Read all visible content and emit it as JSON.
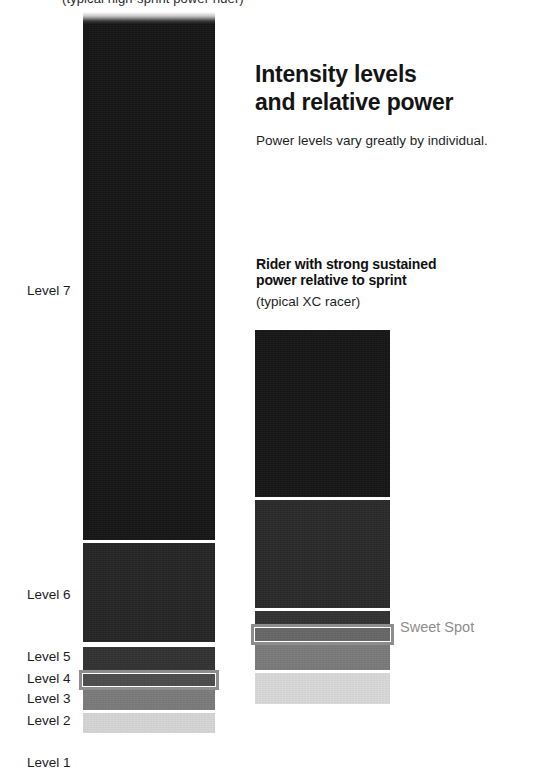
{
  "page": {
    "background": "#ffffff",
    "top_caption": "(typical high-sprint power rider)"
  },
  "headline": {
    "line1": "Intensity levels",
    "line2": "and relative power",
    "subtitle": "Power levels vary greatly by individual."
  },
  "right_chart_heading": {
    "line1": "Rider with strong sustained",
    "line2": "power relative to sprint",
    "sub": "(typical XC racer)"
  },
  "sweet_spot": {
    "label": "Sweet Spot",
    "color": "#8d8d8d"
  },
  "axis": {
    "labels": [
      {
        "text": "Level 7",
        "top": 284
      },
      {
        "text": "Level 6",
        "top": 588
      },
      {
        "text": "Level 5",
        "top": 650
      },
      {
        "text": "Level 4",
        "top": 672
      },
      {
        "text": "Level 3",
        "top": 692
      },
      {
        "text": "Level 2",
        "top": 714
      },
      {
        "text": "Level 1",
        "top": 756
      }
    ]
  },
  "chart_data": {
    "type": "bar",
    "title": "Intensity levels and relative power",
    "subtitle": "Power levels vary greatly by individual.",
    "xlabel": "",
    "ylabel": "Intensity level",
    "orientation": "vertical-stacked",
    "categories": [
      "Level 7",
      "Level 6",
      "Level 5",
      "Level 4",
      "Level 3",
      "Level 2",
      "Level 1"
    ],
    "legend": [
      "Sweet Spot"
    ],
    "grid": false,
    "annotations": [
      "Sweet Spot"
    ],
    "series": [
      {
        "name": "Rider with high sprint power relative to sustained",
        "caption": "(typical high-sprint power rider)",
        "bar_left": 83,
        "bar_right": 215,
        "sweet_spot_level": "Level 4",
        "segments": [
          {
            "level": "Level 7",
            "top": 12,
            "bottom": 540,
            "height": 528,
            "color": "#171717",
            "fade_top": true
          },
          {
            "level": "Level 6",
            "top": 543,
            "bottom": 642,
            "height": 99,
            "color": "#262626"
          },
          {
            "level": "Level 5",
            "top": 647,
            "bottom": 670,
            "height": 23,
            "color": "#333333"
          },
          {
            "level": "Level 4",
            "top": 674,
            "bottom": 686,
            "height": 12,
            "color": "#4d4d4d"
          },
          {
            "level": "Level 3",
            "top": 690,
            "bottom": 710,
            "height": 20,
            "color": "#7b7b7b"
          },
          {
            "level": "Level 2",
            "top": 713,
            "bottom": 733,
            "height": 20,
            "color": "#d6d6d6"
          }
        ]
      },
      {
        "name": "Rider with strong sustained power relative to sprint",
        "caption": "(typical XC racer)",
        "bar_left": 255,
        "bar_right": 390,
        "sweet_spot_level": "Level 4",
        "segments": [
          {
            "level": "Level 7",
            "top": 330,
            "bottom": 497,
            "height": 167,
            "color": "#171717"
          },
          {
            "level": "Level 6",
            "top": 500,
            "bottom": 608,
            "height": 108,
            "color": "#2b2b2b"
          },
          {
            "level": "Level 5",
            "top": 611,
            "bottom": 624,
            "height": 13,
            "color": "#333333"
          },
          {
            "level": "Level 4",
            "top": 628,
            "bottom": 641,
            "height": 13,
            "color": "#686868"
          },
          {
            "level": "Level 3",
            "top": 645,
            "bottom": 670,
            "height": 25,
            "color": "#7b7b7b"
          },
          {
            "level": "Level 2",
            "top": 673,
            "bottom": 704,
            "height": 31,
            "color": "#d9d9d9"
          }
        ]
      }
    ]
  }
}
